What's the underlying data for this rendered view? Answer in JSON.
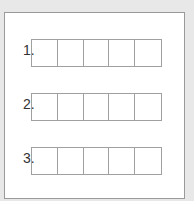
{
  "rows": [
    {
      "label": "1.",
      "cells": 5
    },
    {
      "label": "2.",
      "cells": 5
    },
    {
      "label": "3.",
      "cells": 5
    }
  ]
}
